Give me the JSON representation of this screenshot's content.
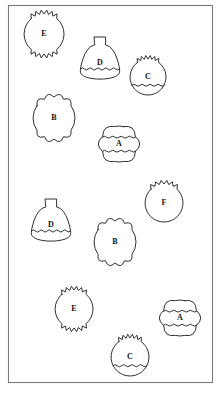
{
  "figure": {
    "background_color": "#ffffff",
    "frame": {
      "x": 8,
      "y": 5,
      "width": 204,
      "height": 377,
      "stroke_color": "#7a7a7a"
    },
    "stroke_color": "#1a1a1a",
    "fill_color": "#ffffff",
    "label_color": "#111111"
  },
  "legend": {
    "shape_types": [
      {
        "key": "A",
        "description": "wide lobed body with two wavy bands"
      },
      {
        "key": "B",
        "description": "round body with scalloped top and bottom"
      },
      {
        "key": "C",
        "description": "pot with spiked rim and lower wavy band"
      },
      {
        "key": "D",
        "description": "bell dome with neck and lower wavy band"
      },
      {
        "key": "E",
        "description": "circle with spiked top and spiked bottom"
      },
      {
        "key": "F",
        "description": "circle with spiked top only"
      }
    ]
  },
  "shapes": [
    {
      "id": "shape-1",
      "label": "E",
      "type": "E",
      "cx": 44,
      "cy": 34,
      "r": 20
    },
    {
      "id": "shape-2",
      "label": "D",
      "type": "D",
      "cx": 100,
      "cy": 63,
      "r": 20
    },
    {
      "id": "shape-3",
      "label": "C",
      "type": "C",
      "cx": 148,
      "cy": 77,
      "r": 18
    },
    {
      "id": "shape-4",
      "label": "B",
      "type": "B",
      "cx": 54,
      "cy": 118,
      "r": 21
    },
    {
      "id": "shape-5",
      "label": "A",
      "type": "A",
      "cx": 119,
      "cy": 144,
      "r": 18
    },
    {
      "id": "shape-6",
      "label": "F",
      "type": "F",
      "cx": 164,
      "cy": 203,
      "r": 19
    },
    {
      "id": "shape-7",
      "label": "D",
      "type": "D",
      "cx": 51,
      "cy": 225,
      "r": 20
    },
    {
      "id": "shape-8",
      "label": "B",
      "type": "B",
      "cx": 115,
      "cy": 242,
      "r": 21
    },
    {
      "id": "shape-9",
      "label": "E",
      "type": "E",
      "cx": 74,
      "cy": 309,
      "r": 19
    },
    {
      "id": "shape-10",
      "label": "A",
      "type": "A",
      "cx": 180,
      "cy": 318,
      "r": 18
    },
    {
      "id": "shape-11",
      "label": "C",
      "type": "C",
      "cx": 130,
      "cy": 357,
      "r": 19
    }
  ]
}
